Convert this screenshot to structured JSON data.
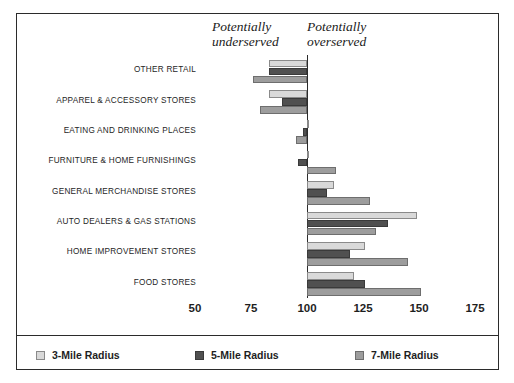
{
  "chart_data": {
    "type": "bar",
    "orientation": "horizontal",
    "title": "",
    "xlabel": "",
    "ylabel": "",
    "xlim": [
      50,
      175
    ],
    "xticks": [
      50,
      75,
      100,
      125,
      150,
      175
    ],
    "baseline": 100,
    "grid": false,
    "legend_position": "bottom",
    "categories": [
      "OTHER RETAIL",
      "APPAREL & ACCESSORY STORES",
      "EATING AND DRINKING PLACES",
      "FURNITURE & HOME FURNISHINGS",
      "GENERAL MERCHANDISE STORES",
      "AUTO DEALERS & GAS STATIONS",
      "HOME IMPROVEMENT STORES",
      "FOOD STORES"
    ],
    "series": [
      {
        "name": "3-Mile Radius",
        "color": "#d9d9d9",
        "values": [
          83,
          83,
          101,
          100,
          112,
          149,
          126,
          121
        ]
      },
      {
        "name": "5-Mile Radius",
        "color": "#505050",
        "values": [
          83,
          89,
          98,
          96,
          109,
          136,
          119,
          126
        ]
      },
      {
        "name": "7-Mile Radius",
        "color": "#9d9d9d",
        "values": [
          76,
          79,
          95,
          113,
          128,
          131,
          145,
          151
        ]
      }
    ],
    "annotations": [
      {
        "text": "Potentially\nunderserved",
        "side": "left"
      },
      {
        "text": "Potentially\noverserved",
        "side": "right"
      }
    ]
  }
}
